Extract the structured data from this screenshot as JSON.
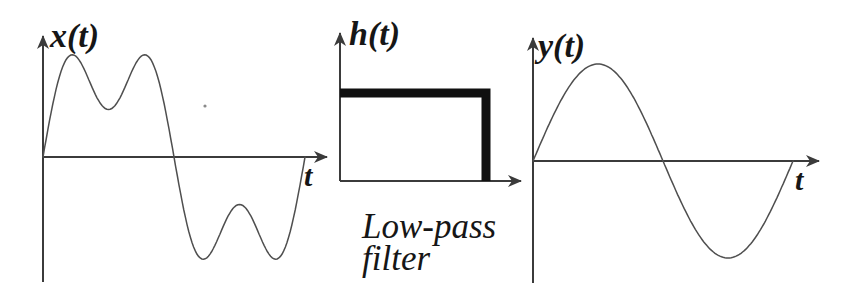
{
  "figure": {
    "colors": {
      "background": "#ffffff",
      "axis": "#3b3b3b",
      "curve": "#4f4f4f",
      "thick": "#101010",
      "ink": "#161616"
    }
  },
  "caption": {
    "line1": "Low-pass",
    "line2": "filter",
    "x": 362,
    "y_line1": 238,
    "y_line2": 270
  },
  "chart_data": [
    {
      "type": "line",
      "title": "x(t)",
      "xlabel": "t",
      "description": "input signal: fundamental sine plus third harmonic (half amplitude), one full period",
      "harmonics": [
        {
          "n": 1,
          "a": 1.0
        },
        {
          "n": 3,
          "a": 0.5
        }
      ]
    },
    {
      "type": "line",
      "title": "h(t)",
      "xlabel": "",
      "description": "ideal rectangular response: constant value from 0 to cutoff, then drops to zero",
      "values": [
        1,
        1,
        0
      ]
    },
    {
      "type": "line",
      "title": "y(t)",
      "xlabel": "t",
      "description": "output signal: pure sine wave, one full period",
      "harmonics": [
        {
          "n": 1,
          "a": 1.0
        }
      ]
    }
  ],
  "plots": [
    {
      "label": "x(t)",
      "time_label": "t",
      "origin": {
        "x": 43,
        "y": 157
      },
      "axis": {
        "x_end": 327,
        "y_top": 36,
        "y_bottom": 282
      },
      "curve": {
        "type": "harmonic_sum",
        "amplitude": 95,
        "period": 262,
        "harmonics": [
          {
            "n": 1,
            "a": 1.0
          },
          {
            "n": 3,
            "a": 0.5
          }
        ]
      },
      "label_pos": {
        "x": 50,
        "y": 47
      },
      "time_label_pos": {
        "x": 304,
        "y": 186
      }
    },
    {
      "label": "h(t)",
      "origin": {
        "x": 340,
        "y": 181
      },
      "axis": {
        "x_end": 521,
        "y_top": 33,
        "y_bottom": 181
      },
      "response_rect": {
        "top_y": 93,
        "right_x": 486,
        "stroke_width": 9
      },
      "label_pos": {
        "x": 349,
        "y": 45
      }
    },
    {
      "label": "y(t)",
      "time_label": "t",
      "origin": {
        "x": 533,
        "y": 161
      },
      "axis": {
        "x_end": 819,
        "y_top": 38,
        "y_bottom": 283
      },
      "curve": {
        "type": "harmonic_sum",
        "amplitude": 97,
        "period": 260,
        "harmonics": [
          {
            "n": 1,
            "a": 1.0
          }
        ]
      },
      "label_pos": {
        "x": 538,
        "y": 57
      },
      "time_label_pos": {
        "x": 795,
        "y": 190
      }
    }
  ],
  "artifact_dot": {
    "x": 205,
    "y": 106,
    "r": 1.6
  }
}
